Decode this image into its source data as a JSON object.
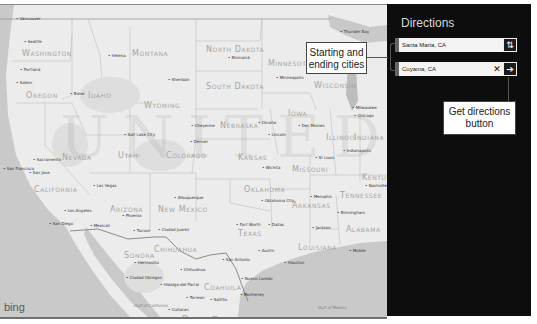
{
  "map": {
    "brand": "bing",
    "watermark": "UNITED STATES",
    "states": [
      {
        "name": "Washington",
        "x": 22,
        "y": 44
      },
      {
        "name": "Oregon",
        "x": 26,
        "y": 86
      },
      {
        "name": "Idaho",
        "x": 88,
        "y": 86
      },
      {
        "name": "Montana",
        "x": 132,
        "y": 44
      },
      {
        "name": "Wyoming",
        "x": 144,
        "y": 96
      },
      {
        "name": "North Dakota",
        "x": 206,
        "y": 40
      },
      {
        "name": "South Dakota",
        "x": 206,
        "y": 77
      },
      {
        "name": "Minnesota",
        "x": 268,
        "y": 54
      },
      {
        "name": "Wisconsin",
        "x": 314,
        "y": 76
      },
      {
        "name": "Nevada",
        "x": 62,
        "y": 148
      },
      {
        "name": "Utah",
        "x": 118,
        "y": 146
      },
      {
        "name": "Colorado",
        "x": 166,
        "y": 146
      },
      {
        "name": "Nebraska",
        "x": 220,
        "y": 116
      },
      {
        "name": "Iowa",
        "x": 288,
        "y": 104
      },
      {
        "name": "Kansas",
        "x": 238,
        "y": 148
      },
      {
        "name": "Missouri",
        "x": 292,
        "y": 160
      },
      {
        "name": "Illinois",
        "x": 326,
        "y": 128
      },
      {
        "name": "Indiana",
        "x": 354,
        "y": 128
      },
      {
        "name": "California",
        "x": 34,
        "y": 180
      },
      {
        "name": "Arizona",
        "x": 110,
        "y": 200
      },
      {
        "name": "New Mexico",
        "x": 158,
        "y": 200
      },
      {
        "name": "Oklahoma",
        "x": 244,
        "y": 180
      },
      {
        "name": "Arkansas",
        "x": 292,
        "y": 196
      },
      {
        "name": "Tennessee",
        "x": 340,
        "y": 186
      },
      {
        "name": "Kentucky",
        "x": 362,
        "y": 168
      },
      {
        "name": "Texas",
        "x": 238,
        "y": 224
      },
      {
        "name": "Louisiana",
        "x": 298,
        "y": 238
      },
      {
        "name": "Alabama",
        "x": 346,
        "y": 220
      }
    ],
    "cities": [
      {
        "name": "Vancouver",
        "x": 16,
        "y": 11
      },
      {
        "name": "Seattle",
        "x": 24,
        "y": 34
      },
      {
        "name": "Portland",
        "x": 20,
        "y": 62
      },
      {
        "name": "Salem",
        "x": 16,
        "y": 75
      },
      {
        "name": "Boise",
        "x": 70,
        "y": 86
      },
      {
        "name": "Helena",
        "x": 108,
        "y": 48
      },
      {
        "name": "Sheridan",
        "x": 168,
        "y": 72
      },
      {
        "name": "Bismarck",
        "x": 228,
        "y": 50
      },
      {
        "name": "Minneapolis",
        "x": 276,
        "y": 70
      },
      {
        "name": "Thunder Bay",
        "x": 340,
        "y": 24
      },
      {
        "name": "Milwaukee",
        "x": 352,
        "y": 100
      },
      {
        "name": "Chicago",
        "x": 354,
        "y": 108
      },
      {
        "name": "Salt Lake City",
        "x": 124,
        "y": 127
      },
      {
        "name": "Cheyenne",
        "x": 191,
        "y": 118
      },
      {
        "name": "Denver",
        "x": 190,
        "y": 134
      },
      {
        "name": "Omaha",
        "x": 258,
        "y": 115
      },
      {
        "name": "Lincoln",
        "x": 268,
        "y": 127
      },
      {
        "name": "Des Moines",
        "x": 298,
        "y": 118
      },
      {
        "name": "Indianapolis",
        "x": 343,
        "y": 143
      },
      {
        "name": "St Louis",
        "x": 315,
        "y": 150
      },
      {
        "name": "Wichita",
        "x": 262,
        "y": 160
      },
      {
        "name": "Nashville",
        "x": 365,
        "y": 178
      },
      {
        "name": "Sacramento",
        "x": 33,
        "y": 152
      },
      {
        "name": "San Jose",
        "x": 29,
        "y": 165
      },
      {
        "name": "San Francisco",
        "x": 3,
        "y": 161
      },
      {
        "name": "Las Vegas",
        "x": 93,
        "y": 178
      },
      {
        "name": "Los Angeles",
        "x": 64,
        "y": 203
      },
      {
        "name": "Albuquerque",
        "x": 174,
        "y": 190
      },
      {
        "name": "Oklahoma City",
        "x": 261,
        "y": 193
      },
      {
        "name": "Memphis",
        "x": 310,
        "y": 189
      },
      {
        "name": "Birmingham",
        "x": 337,
        "y": 205
      },
      {
        "name": "Phoenix",
        "x": 122,
        "y": 208
      },
      {
        "name": "San Diego",
        "x": 49,
        "y": 216
      },
      {
        "name": "Mexicali",
        "x": 90,
        "y": 218
      },
      {
        "name": "Tucson",
        "x": 133,
        "y": 223
      },
      {
        "name": "Ciudad Juarez",
        "x": 158,
        "y": 222
      },
      {
        "name": "Fort Worth",
        "x": 236,
        "y": 217
      },
      {
        "name": "Dallas",
        "x": 268,
        "y": 217
      },
      {
        "name": "Jackson",
        "x": 312,
        "y": 220
      },
      {
        "name": "Austin",
        "x": 258,
        "y": 243
      },
      {
        "name": "San Antonio",
        "x": 222,
        "y": 252
      },
      {
        "name": "Houston",
        "x": 284,
        "y": 255
      },
      {
        "name": "Mobile",
        "x": 349,
        "y": 243
      },
      {
        "name": "Hermosillo",
        "x": 134,
        "y": 255
      },
      {
        "name": "Chihuahua",
        "x": 180,
        "y": 262
      },
      {
        "name": "Ciudad Obregon",
        "x": 126,
        "y": 270
      },
      {
        "name": "Nuevo Laredo",
        "x": 241,
        "y": 271
      },
      {
        "name": "Hidalgo del Parral",
        "x": 160,
        "y": 277
      },
      {
        "name": "Monterrey",
        "x": 240,
        "y": 287
      },
      {
        "name": "Torreon",
        "x": 186,
        "y": 290
      },
      {
        "name": "Saltillo",
        "x": 210,
        "y": 292
      },
      {
        "name": "Culiacan",
        "x": 168,
        "y": 302
      }
    ],
    "regions": [
      {
        "name": "Sonora",
        "x": 124,
        "y": 246
      },
      {
        "name": "Chihuahua",
        "x": 154,
        "y": 240
      },
      {
        "name": "Coahuila",
        "x": 204,
        "y": 278
      },
      {
        "name": "Durango",
        "x": 182,
        "y": 310
      },
      {
        "name": "Zacatecas",
        "x": 212,
        "y": 311
      }
    ],
    "water": [
      {
        "name": "Gulf of Mexico",
        "x": 318,
        "y": 300
      },
      {
        "name": "Gulf of California",
        "x": 134,
        "y": 298
      }
    ]
  },
  "directions": {
    "title": "Directions",
    "start": {
      "value": "Santa Maria, CA",
      "marker": "A"
    },
    "end": {
      "value": "Cuyama, CA",
      "marker": "B"
    },
    "swap_icon": "⇅",
    "clear_icon": "✕",
    "go_icon": "➔"
  },
  "callouts": {
    "cities": "Starting and ending cities",
    "cities_line1": "Starting and",
    "cities_line2": "ending cities",
    "button_line1": "Get directions",
    "button_line2": "button"
  },
  "colors": {
    "panel_bg": "#0d0d0d",
    "map_bg": "#ececec",
    "water": "#c9c9c9"
  }
}
